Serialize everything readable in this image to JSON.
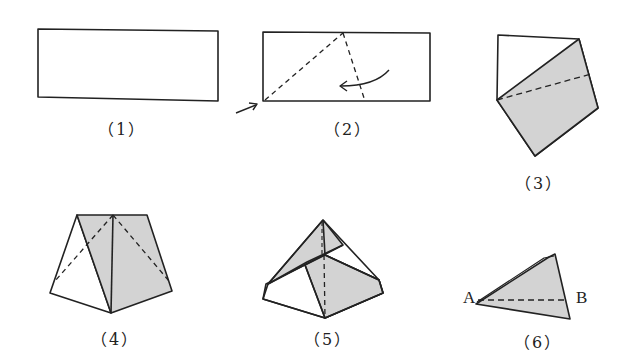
{
  "figure": {
    "type": "paper-folding-steps",
    "shade_color": "#d3d3d3",
    "line_color": "#222222",
    "steps": [
      {
        "id": 1,
        "label": "（1）",
        "description": "rectangular sheet of paper"
      },
      {
        "id": 2,
        "label": "（2）",
        "description": "fold along dashed lines; arrows show fold direction"
      },
      {
        "id": 3,
        "label": "（3）",
        "description": "folded piece with shaded region and dashed crease"
      },
      {
        "id": 4,
        "label": "（4）",
        "description": "trapezoid-shaped fold with diagonal dashed creases"
      },
      {
        "id": 5,
        "label": "（5）",
        "description": "pyramid-like fold with vertical dashed crease"
      },
      {
        "id": 6,
        "label": "（6）",
        "description": "triangular piece with dashed line from A toward B"
      }
    ],
    "points": {
      "A": "A",
      "B": "B"
    }
  }
}
